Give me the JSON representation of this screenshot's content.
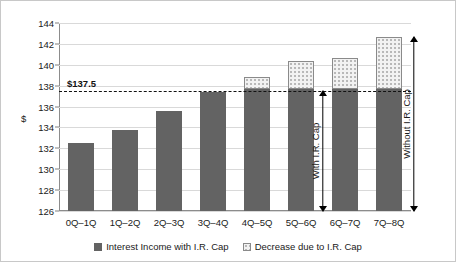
{
  "chart_data": {
    "type": "bar",
    "title": "",
    "xlabel": "",
    "ylabel": "$",
    "ylim": [
      126,
      144
    ],
    "ytick_step": 2,
    "yticks": [
      126,
      128,
      130,
      132,
      134,
      136,
      138,
      140,
      142,
      144
    ],
    "grid": true,
    "stacked": true,
    "legend_position": "bottom",
    "categories": [
      "0Q–1Q",
      "1Q–2Q",
      "2Q–3Q",
      "3Q–4Q",
      "4Q–5Q",
      "5Q–6Q",
      "6Q–7Q",
      "7Q–8Q"
    ],
    "series": [
      {
        "name": "Interest Income with I.R. Cap",
        "color": "#636363",
        "values": [
          132.5,
          133.8,
          135.6,
          137.35,
          137.7,
          137.7,
          137.7,
          137.7
        ]
      },
      {
        "name": "Decrease due to I.R. Cap",
        "color": "#f2f2f2",
        "values": [
          0,
          0,
          0,
          0,
          1.15,
          2.65,
          2.95,
          4.95
        ]
      }
    ],
    "totals": [
      132.5,
      133.8,
      135.6,
      137.35,
      138.85,
      140.35,
      140.65,
      142.65
    ],
    "reference_line": {
      "label": "$137.5",
      "value": 137.5,
      "style": "dashed",
      "color": "#111111"
    },
    "annotations": [
      {
        "name": "with-cap",
        "label": "With I.R. Cap",
        "from": 126,
        "to": 137.5,
        "category_anchor": "6Q–7Q"
      },
      {
        "name": "without-cap",
        "label": "Without I.R. Cap",
        "from": 126,
        "to": 142.65,
        "category_anchor": "7Q–8Q"
      }
    ]
  },
  "legend": {
    "items": [
      {
        "label": "Interest Income with I.R. Cap",
        "swatch": "solid-square-icon"
      },
      {
        "label": "Decrease due to I.R. Cap",
        "swatch": "dotted-square-icon"
      }
    ]
  }
}
